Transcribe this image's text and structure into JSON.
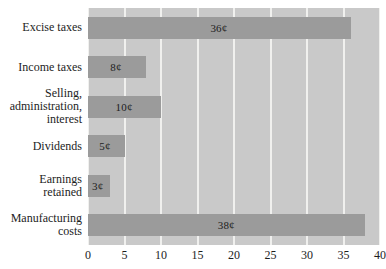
{
  "chart_data": {
    "type": "bar",
    "orientation": "horizontal",
    "title": "",
    "xlabel": "",
    "ylabel": "",
    "xlim": [
      0,
      40
    ],
    "xticks": [
      0,
      5,
      10,
      15,
      20,
      25,
      30,
      35,
      40
    ],
    "xtick_labels": [
      "0",
      "5",
      "10",
      "15",
      "20",
      "25",
      "30",
      "35",
      "40"
    ],
    "grid": true,
    "grid_axis": "x",
    "legend": false,
    "unit_symbol": "¢",
    "categories": [
      "Excise taxes",
      "Income taxes",
      "Selling,\nadministration,\ninterest",
      "Dividends",
      "Earnings\nretained",
      "Manufacturing\ncosts"
    ],
    "values": [
      36,
      8,
      10,
      5,
      3,
      38
    ],
    "data_labels": [
      "36¢",
      "8¢",
      "10¢",
      "5¢",
      "3¢",
      "38¢"
    ],
    "colors": {
      "bar": "#9b9b9b",
      "plot_background": "#c9c9c9",
      "gridline": "#f0f0ee",
      "text": "#1d1d1d",
      "figure_background": "#ffffff"
    }
  },
  "clipped_header": ""
}
